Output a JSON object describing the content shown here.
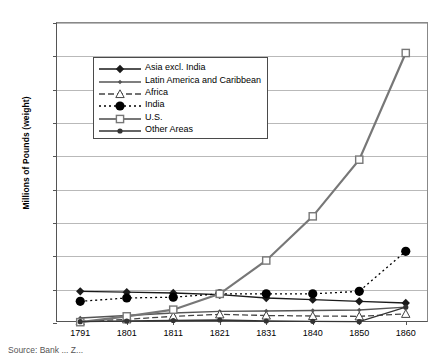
{
  "chart_data": {
    "type": "line",
    "title": "",
    "xlabel": "",
    "ylabel": "Millions of Pounds (weight)",
    "categories": [
      "1791",
      "1801",
      "1811",
      "1821",
      "1831",
      "1840",
      "1850",
      "1860"
    ],
    "ylim": [
      0,
      1800
    ],
    "ytick_step": 200,
    "yticks": [
      0,
      200,
      400,
      600,
      800,
      1000,
      1200,
      1400,
      1600,
      1800
    ],
    "grid": true,
    "legend_position": "upper-left-inside",
    "series": [
      {
        "name": "Asia excl. India",
        "marker": "filled-diamond",
        "linestyle": "solid",
        "color": "#1a1a1a",
        "values": [
          190,
          185,
          180,
          170,
          150,
          140,
          130,
          120
        ]
      },
      {
        "name": "Latin America and Caribbean",
        "marker": "small-diamond",
        "linestyle": "solid",
        "color": "#555555",
        "values": [
          30,
          45,
          60,
          70,
          72,
          75,
          78,
          95
        ]
      },
      {
        "name": "Africa",
        "marker": "open-triangle",
        "linestyle": "dashed",
        "color": "#444444",
        "values": [
          10,
          22,
          40,
          52,
          45,
          42,
          40,
          55
        ]
      },
      {
        "name": "India",
        "marker": "large-filled-circle",
        "linestyle": "dotted",
        "color": "#000000",
        "values": [
          130,
          150,
          155,
          175,
          175,
          175,
          190,
          430
        ]
      },
      {
        "name": "U.S.",
        "marker": "open-square",
        "linestyle": "solid-thick",
        "color": "#777777",
        "values": [
          5,
          40,
          80,
          175,
          375,
          640,
          980,
          1620
        ]
      },
      {
        "name": "Other Areas",
        "marker": "filled-circle",
        "linestyle": "solid",
        "color": "#333333",
        "values": [
          8,
          12,
          15,
          18,
          12,
          10,
          8,
          95
        ]
      }
    ]
  },
  "caption": "Source: Bank ... Z..."
}
